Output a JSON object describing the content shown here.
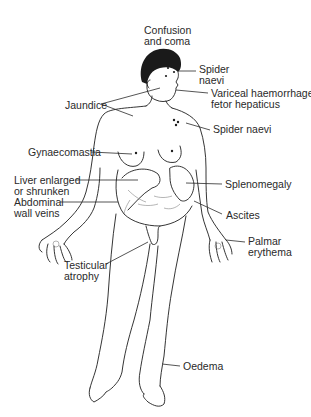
{
  "diagram": {
    "type": "anatomical-illustration",
    "colors": {
      "ink": "#1e1e1e",
      "background": "#ffffff"
    },
    "labels": [
      {
        "id": "confusion",
        "text": "Confusion\nand coma"
      },
      {
        "id": "spider-naevi-face",
        "text": "Spider\nnaevi"
      },
      {
        "id": "variceal",
        "text": "Variceal haemorrhage\nfetor hepaticus"
      },
      {
        "id": "jaundice",
        "text": "Jaundice"
      },
      {
        "id": "spider-naevi-chest",
        "text": "Spider naevi"
      },
      {
        "id": "gynaecomastia",
        "text": "Gynaecomastia"
      },
      {
        "id": "liver",
        "text": "Liver enlarged\nor shrunken"
      },
      {
        "id": "abdominal-veins",
        "text": "Abdominal\nwall veins"
      },
      {
        "id": "splenomegaly",
        "text": "Splenomegaly"
      },
      {
        "id": "ascites",
        "text": "Ascites"
      },
      {
        "id": "palmar",
        "text": "Palmar\nerythema"
      },
      {
        "id": "testicular",
        "text": "Testicular\natrophy"
      },
      {
        "id": "oedema",
        "text": "Oedema"
      }
    ]
  }
}
